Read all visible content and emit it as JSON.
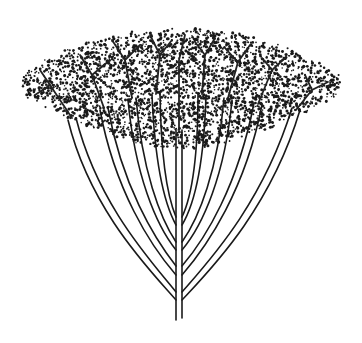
{
  "image": {
    "subject": "Pen-and-ink stippled illustration of an umbrella-shaped tree",
    "background_color": "#ffffff",
    "ink_color": "#1a1a1a"
  },
  "canopy": {
    "center_x": 180,
    "top_y": 20,
    "bottom_y": 150,
    "left_x": 22,
    "right_x": 340
  },
  "trunk": {
    "base_x": 179,
    "base_y": 320,
    "fork_y": 240
  }
}
